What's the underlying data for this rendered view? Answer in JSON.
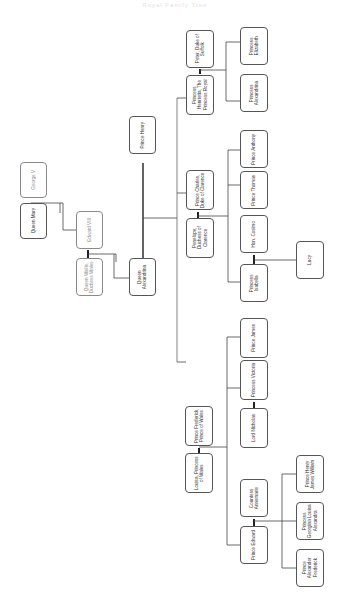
{
  "diagram": {
    "title": "Royal Family Tree",
    "type": "family-tree",
    "orientation": "rotated-90",
    "colors": {
      "line": "#333333",
      "box_border": "#555555",
      "faded_text": "#8a8a8a",
      "background": "#ffffff"
    },
    "nodes": {
      "george_v": "George V",
      "queen_mary": "Queen Mary",
      "edward_viii": "Edward VIII",
      "queen_wallis": "Queen Wallis, Duchess Wales",
      "queen_alexandrina": "Queen Alexandrina",
      "prince_henry": "Prince Henry",
      "peter_suffolk": "Peter, Duke of Suffolk",
      "princess_henrietta": "Princess Henrietta, The Princess Royal",
      "princess_elizabeth": "Princess Elizabeth",
      "princess_alexandrina": "Princess Alexandrina",
      "prince_charles": "Prince Charles, Duke of Clarence",
      "penelope": "Penelope, Duchess of Clarence",
      "prince_anthony": "Prince Anthony",
      "prince_thomas": "Prince Thomas",
      "hon_cosimo": "Hon. Cosimo",
      "princess_isabella": "Princess Isabella",
      "lucy": "Lucy",
      "prince_frederick": "Prince Frederick, Prince of Wales",
      "louisa": "Louisa, Princess of Wales",
      "prince_james": "Prince James",
      "princess_victoria": "Princess Victoria",
      "lord_nicholas": "Lord Nicholas",
      "countess_annemarie": "Countess Annemarie",
      "prince_edward": "Prince Edward",
      "prince_henry_james": "Prince Henry James William",
      "princess_georgina": "Princess Georgina Louisa Alexandra",
      "prince_alexander": "Prince Alexander Frederick"
    }
  }
}
